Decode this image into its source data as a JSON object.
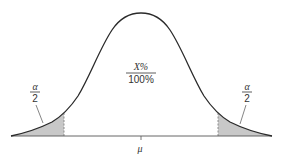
{
  "diagram": {
    "type": "normal-distribution-two-tailed",
    "center_label": {
      "numerator": "X%",
      "denominator": "100%"
    },
    "left_tail_label": {
      "numerator": "α",
      "denominator": "2"
    },
    "right_tail_label": {
      "numerator": "α",
      "denominator": "2"
    },
    "mean_label": "μ",
    "colors": {
      "curve": "#2a2a2a",
      "shaded_tail": "#c8c8c8",
      "baseline": "#555555",
      "text": "#333333"
    }
  }
}
